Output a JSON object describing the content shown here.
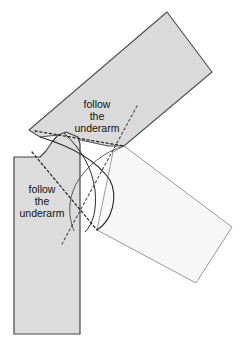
{
  "diagram": {
    "kind": "sewing-pattern-armhole-sleeve-rotation",
    "background_color": "#ffffff"
  },
  "colors": {
    "bodice_fill": "#dcdcdc",
    "sleeve_fill": "#dadada",
    "sleeve_rotated_fill": "#f7f7f7",
    "outline_dark": "#3a3a3a",
    "outline_light": "#9a9a9a",
    "seam_line": "#2b2b2b",
    "dotted_line": "#2b2b2b",
    "text_color": "#111111"
  },
  "annotations": [
    {
      "id": "upper-underarm-label",
      "lines": [
        "follow",
        "the",
        "underarm"
      ],
      "x": 97,
      "y": 105,
      "line_height": 12
    },
    {
      "id": "lower-underarm-label",
      "lines": [
        "follow",
        "the",
        "underarm"
      ],
      "x": 42,
      "y": 190,
      "line_height": 12
    }
  ],
  "shapes": {
    "bodice": {
      "name": "bodice-front-piece",
      "path": "M 14 157 L 40 157 L 46 151 L 52 142 L 58 135 L 66 132 L 78 137 L 80 144 L 80 334 L 14 334 Z"
    },
    "sleeve_up": {
      "name": "sleeve-piece-raised",
      "path": "M 29 130 L 167 12 L 212 72 L 124 146 L 108 146 L 58 135 L 40 137 Z"
    },
    "sleeve_rotated": {
      "name": "sleeve-piece-rotated",
      "path": "M 124 146 L 113 152 L 97 230 L 196 283 L 232 227 Z"
    },
    "armhole_curve_outer": {
      "name": "armhole-curve-outer",
      "path": "M 40 137 C 70 146 96 160 110 180 C 118 196 113 220 97 230"
    },
    "armhole_curve_inner": {
      "name": "armhole-curve-inner",
      "path": "M 64 133 C 82 150 92 168 95 190 C 97 210 93 224 85 232"
    },
    "armhole_curve_mid": {
      "name": "armhole-curve-mid",
      "path": "M 124 146 C 104 152 86 166 76 184 C 68 200 68 216 74 231"
    }
  },
  "guides": {
    "dotted_upper": {
      "name": "dotted-guide-upper-underarm",
      "path": "M 35 131 L 124 146"
    },
    "dotted_lower": {
      "name": "dotted-guide-lower-underarm",
      "path": "M 32 152 L 97 230"
    },
    "dotted_diagonal": {
      "name": "dotted-guide-rotation-axis",
      "path": "M 137 106 L 62 244"
    }
  }
}
